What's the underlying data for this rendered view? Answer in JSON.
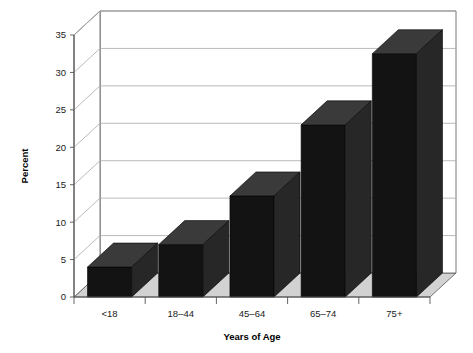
{
  "chart_data": {
    "type": "bar",
    "title": "",
    "subtitle": "",
    "xlabel": "Years of Age",
    "ylabel": "Percent",
    "categories": [
      "<18",
      "18–44",
      "45–64",
      "65–74",
      "75+"
    ],
    "values": [
      4,
      7,
      13.5,
      23,
      32.5
    ],
    "ylim": [
      0,
      35
    ],
    "yticks": [
      0,
      5,
      10,
      15,
      20,
      25,
      30,
      35
    ],
    "ytick_labels": [
      "0",
      "5",
      "10",
      "15",
      "20",
      "25",
      "30",
      "35"
    ],
    "grid": true,
    "legend": null,
    "legend_position": "none",
    "annotations": [],
    "style": {
      "three_d": true,
      "bar_face_color": "#131313",
      "bar_top_color": "#3a3a3a",
      "bar_side_color": "#272727",
      "floor_color": "#d2d2d2",
      "wall_color": "#ffffff",
      "gridline_color": "#aaaaaa",
      "axis_color": "#555555",
      "background_color": "#ffffff"
    }
  }
}
